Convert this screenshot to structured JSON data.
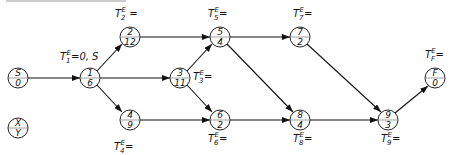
{
  "diagram": {
    "type": "activity-on-node network",
    "nodes": [
      {
        "id": "S",
        "top": "S",
        "bottom": "0",
        "x": 18,
        "y": 78
      },
      {
        "id": "1",
        "top": "1",
        "bottom": "6",
        "x": 90,
        "y": 78
      },
      {
        "id": "2",
        "top": "2",
        "bottom": "12",
        "x": 130,
        "y": 37
      },
      {
        "id": "3",
        "top": "3",
        "bottom": "11",
        "x": 180,
        "y": 78
      },
      {
        "id": "4",
        "top": "4",
        "bottom": "9",
        "x": 130,
        "y": 120
      },
      {
        "id": "5",
        "top": "5",
        "bottom": "4",
        "x": 220,
        "y": 37
      },
      {
        "id": "6",
        "top": "6",
        "bottom": "2",
        "x": 220,
        "y": 120
      },
      {
        "id": "7",
        "top": "7",
        "bottom": "2",
        "x": 300,
        "y": 37
      },
      {
        "id": "8",
        "top": "8",
        "bottom": "4",
        "x": 300,
        "y": 120
      },
      {
        "id": "9",
        "top": "9",
        "bottom": "3",
        "x": 388,
        "y": 120
      },
      {
        "id": "F",
        "top": "F",
        "bottom": "0",
        "x": 435,
        "y": 78
      }
    ],
    "legend_node": {
      "top": "X",
      "bottom": "Y"
    },
    "edges": [
      [
        "S",
        "1"
      ],
      [
        "1",
        "2"
      ],
      [
        "1",
        "3"
      ],
      [
        "1",
        "4"
      ],
      [
        "2",
        "5"
      ],
      [
        "3",
        "5"
      ],
      [
        "3",
        "6"
      ],
      [
        "4",
        "6"
      ],
      [
        "5",
        "7"
      ],
      [
        "5",
        "8"
      ],
      [
        "6",
        "8"
      ],
      [
        "7",
        "9"
      ],
      [
        "8",
        "9"
      ],
      [
        "9",
        "F"
      ]
    ],
    "labels": {
      "t1": {
        "main": "T",
        "sub": "1",
        "sup": "E",
        "rest": "=0, S"
      },
      "t2": {
        "main": "T",
        "sub": "2",
        "sup": "E",
        "rest": " ="
      },
      "t3": {
        "main": "T",
        "sub": "3",
        "sup": "E",
        "rest": "="
      },
      "t4": {
        "main": "T",
        "sub": "4",
        "sup": "E",
        "rest": "="
      },
      "t5": {
        "main": "T",
        "sub": "5",
        "sup": "E",
        "rest": "="
      },
      "t6": {
        "main": "T",
        "sub": "6",
        "sup": "E",
        "rest": "="
      },
      "t7": {
        "main": "T",
        "sub": "7",
        "sup": "E",
        "rest": "="
      },
      "t8": {
        "main": "T",
        "sub": "8",
        "sup": "E",
        "rest": "="
      },
      "t9": {
        "main": "T",
        "sub": "9",
        "sup": "E",
        "rest": "="
      },
      "tF": {
        "main": "T",
        "sub": "F",
        "sup": "E",
        "rest": "="
      }
    }
  }
}
